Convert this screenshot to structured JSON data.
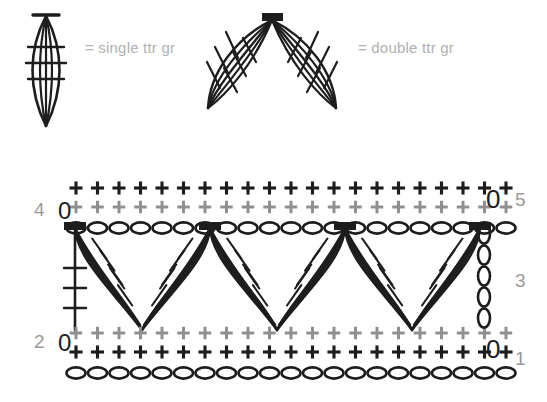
{
  "legend": {
    "items": [
      {
        "symbol_name": "single-ttr-gr-symbol",
        "label": "= single ttr gr"
      },
      {
        "symbol_name": "double-ttr-gr-symbol",
        "label": "= double ttr gr"
      }
    ]
  },
  "chart_labels": {
    "left": [
      {
        "text": "4",
        "row": 4
      },
      {
        "text": "2",
        "row": 2
      }
    ],
    "right": [
      {
        "text": "5",
        "row": 5
      },
      {
        "text": "3",
        "row": 3
      },
      {
        "text": "1",
        "row": 1
      }
    ],
    "turning_chain_marks": [
      {
        "text": "0",
        "side": "left",
        "row": 4
      },
      {
        "text": "0",
        "side": "left",
        "row": 2
      },
      {
        "text": "0",
        "side": "right",
        "row": 5
      },
      {
        "text": "0",
        "side": "right",
        "row": 1
      }
    ]
  },
  "colors": {
    "stitch_black": "#1d1d1d",
    "stitch_gray": "#8f8f8f",
    "label_gray": "#9a9a9a",
    "legend_text": "#b0b0b0",
    "background": "#ffffff"
  },
  "chart_data": {
    "type": "diagram",
    "title": "",
    "notation": "crochet stitch chart",
    "rows": [
      {
        "row": 1,
        "kind": "foundation-chain",
        "symbol": "chain-oval",
        "count": 21,
        "color": "stitch_black",
        "side_label": "1",
        "side": "right"
      },
      {
        "row": 1,
        "kind": "single-crochet-row",
        "symbol": "plus",
        "count": 21,
        "color": "stitch_black"
      },
      {
        "row": 2,
        "kind": "single-crochet-row",
        "symbol": "plus",
        "count": 21,
        "color": "stitch_gray",
        "side_label": "2",
        "side": "left",
        "turning_chain": "0"
      },
      {
        "row": 3,
        "kind": "motif-row",
        "symbol": "double-ttr-gr",
        "motif_count": 3,
        "half_motif_edges": 2,
        "color": "stitch_black",
        "side_label": "3",
        "side": "right",
        "right_turning_chain_count": 5
      },
      {
        "row": 4,
        "kind": "chain-row",
        "symbol": "chain-oval",
        "count": 21,
        "color": "stitch_black",
        "side_label": "4",
        "side": "left",
        "turning_chain": "0"
      },
      {
        "row": 4,
        "kind": "single-crochet-row",
        "symbol": "plus",
        "count": 21,
        "color": "stitch_gray"
      },
      {
        "row": 5,
        "kind": "single-crochet-row",
        "symbol": "plus",
        "count": 21,
        "color": "stitch_black",
        "side_label": "5",
        "side": "right",
        "turning_chain": "0"
      }
    ],
    "motif_anchors_top_x": [
      75,
      210,
      345,
      480
    ],
    "motif_valleys_x": [
      142,
      277,
      412
    ],
    "stitch_spacing_px": 21.5,
    "xlabel": "",
    "ylabel": "",
    "legend_position": "top"
  }
}
